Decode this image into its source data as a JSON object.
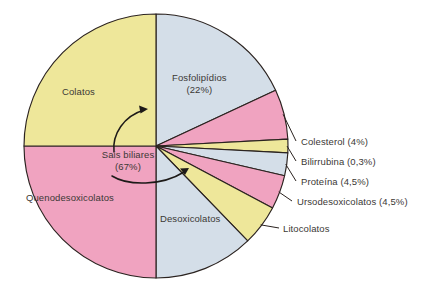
{
  "chart_data": {
    "type": "pie",
    "title": "",
    "subtitle": "",
    "xlabel": "",
    "ylabel": "",
    "legend_position": "none",
    "grid": false,
    "units": "percent of biliary solids",
    "center": {
      "x": 156,
      "y": 146,
      "radius": 132
    },
    "start_angle_deg": -90,
    "direction": "clockwise",
    "groups": [
      {
        "name": "Sais biliares",
        "value": 67,
        "value_label": "(67%)"
      }
    ],
    "categories": [
      "Fosfolipídios",
      "Colesterol",
      "Bilirrubina",
      "Proteína",
      "Ursodesoxicolatos",
      "Litocolatos",
      "Desoxicolatos",
      "Quenodesoxicolatos",
      "Colatos"
    ],
    "values": [
      22,
      4,
      0.3,
      4.5,
      4.5,
      3.2,
      20,
      25,
      16.5
    ],
    "slices": [
      {
        "label": "Fosfolipídios",
        "value": 22,
        "value_label": "(22%)",
        "color": "#d4dee8",
        "start_deg": -90,
        "end_deg": -25,
        "label_placement": "inside"
      },
      {
        "label": "Colesterol",
        "value": 4,
        "value_label": "(4%)",
        "color": "#f0a3c0",
        "start_deg": -25,
        "end_deg": -3,
        "label_placement": "outside"
      },
      {
        "label": "Bilirrubina",
        "value": 0.3,
        "value_label": "(0,3%)",
        "color": "#eee79a",
        "start_deg": -3,
        "end_deg": 3,
        "label_placement": "outside"
      },
      {
        "label": "Proteína",
        "value": 4.5,
        "value_label": "(4,5%)",
        "color": "#d4dee8",
        "start_deg": 3,
        "end_deg": 13,
        "label_placement": "outside"
      },
      {
        "label": "Ursodesoxicolatos",
        "value": 4.5,
        "value_label": "(4,5%)",
        "color": "#f0a3c0",
        "start_deg": 13,
        "end_deg": 28,
        "label_placement": "outside"
      },
      {
        "label": "Litocolatos",
        "value": 3.2,
        "value_label": "",
        "color": "#eee79a",
        "start_deg": 28,
        "end_deg": 46,
        "label_placement": "outside"
      },
      {
        "label": "Desoxicolatos",
        "value": 20,
        "value_label": "",
        "color": "#d4dee8",
        "start_deg": 46,
        "end_deg": 90,
        "label_placement": "inside"
      },
      {
        "label": "Quenodesoxicolatos",
        "value": 25,
        "value_label": "",
        "color": "#f0a3c0",
        "start_deg": 90,
        "end_deg": 180,
        "label_placement": "inside"
      },
      {
        "label": "Colatos",
        "value": 16.5,
        "value_label": "",
        "color": "#eee79a",
        "start_deg": 180,
        "end_deg": 270,
        "label_placement": "inside"
      }
    ],
    "annotations": [
      {
        "text": "Sais biliares",
        "text2": "(67%)",
        "kind": "bracket-callout",
        "points_to": [
          "Colatos",
          "Desoxicolatos"
        ]
      }
    ]
  },
  "labels": {
    "colatos": "Colatos",
    "fosfolipidios_name": "Fosfolipídios",
    "fosfolipidios_value": "(22%)",
    "quenodesoxicolatos": "Quenodesoxicolatos",
    "desoxicolatos": "Desoxicolatos",
    "sais_biliares_name": "Sais biliares",
    "sais_biliares_value": "(67%)",
    "colesterol": "Colesterol (4%)",
    "bilirrubina": "Bilirrubina (0,3%)",
    "proteina": "Proteína (4,5%)",
    "ursodesoxicolatos": "Ursodesoxicolatos (4,5%)",
    "litocolatos": "Litocolatos"
  },
  "colors": {
    "yellow": "#eee79a",
    "pink": "#f0a3c0",
    "bluegrey": "#d4dee8",
    "outline": "#2b2320",
    "background": "#ffffff",
    "text": "#3b3835"
  }
}
